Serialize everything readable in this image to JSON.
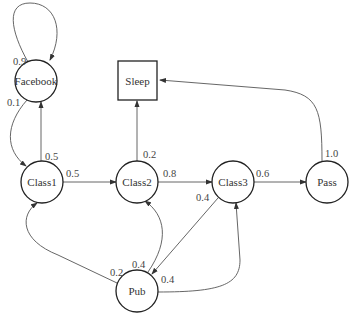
{
  "diagram": {
    "type": "markov-chain",
    "nodes": {
      "facebook": {
        "label": "Facebook",
        "shape": "circle"
      },
      "class1": {
        "label": "Class1",
        "shape": "circle"
      },
      "class2": {
        "label": "Class2",
        "shape": "circle"
      },
      "class3": {
        "label": "Class3",
        "shape": "circle"
      },
      "pass": {
        "label": "Pass",
        "shape": "circle"
      },
      "pub": {
        "label": "Pub",
        "shape": "circle"
      },
      "sleep": {
        "label": "Sleep",
        "shape": "square"
      }
    },
    "edges": {
      "facebook_facebook": {
        "from": "Facebook",
        "to": "Facebook",
        "p": "0.9"
      },
      "facebook_class1": {
        "from": "Facebook",
        "to": "Class1",
        "p": "0.1"
      },
      "class1_facebook": {
        "from": "Class1",
        "to": "Facebook",
        "p": "0.5"
      },
      "class1_class2": {
        "from": "Class1",
        "to": "Class2",
        "p": "0.5"
      },
      "class2_sleep": {
        "from": "Class2",
        "to": "Sleep",
        "p": "0.2"
      },
      "class2_class3": {
        "from": "Class2",
        "to": "Class3",
        "p": "0.8"
      },
      "class3_pass": {
        "from": "Class3",
        "to": "Pass",
        "p": "0.6"
      },
      "class3_pub": {
        "from": "Class3",
        "to": "Pub",
        "p": "0.4"
      },
      "pass_sleep": {
        "from": "Pass",
        "to": "Sleep",
        "p": "1.0"
      },
      "pub_class1": {
        "from": "Pub",
        "to": "Class1",
        "p": "0.2"
      },
      "pub_class2": {
        "from": "Pub",
        "to": "Class2",
        "p": "0.4"
      },
      "pub_class3": {
        "from": "Pub",
        "to": "Class3",
        "p": "0.4"
      }
    }
  }
}
